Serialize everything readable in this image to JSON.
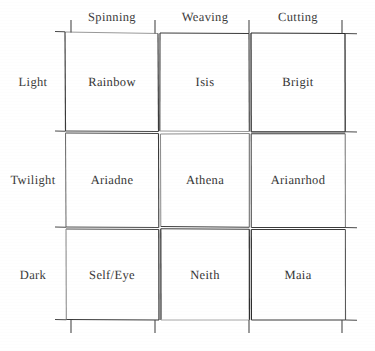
{
  "diagram": {
    "type": "matrix-grid",
    "rows": 3,
    "columns": 3,
    "column_headers": [
      {
        "label": "Spinning"
      },
      {
        "label": "Weaving"
      },
      {
        "label": "Cutting"
      }
    ],
    "row_headers": [
      {
        "label": "Light"
      },
      {
        "label": "Twilight"
      },
      {
        "label": "Dark"
      }
    ],
    "cells": [
      [
        {
          "label": "Rainbow"
        },
        {
          "label": "Isis"
        },
        {
          "label": "Brigit"
        }
      ],
      [
        {
          "label": "Ariadne"
        },
        {
          "label": "Athena"
        },
        {
          "label": "Arianrhod"
        }
      ],
      [
        {
          "label": "Self/Eye"
        },
        {
          "label": "Neith"
        },
        {
          "label": "Maia"
        }
      ]
    ],
    "colors": {
      "background": "#ffffff",
      "ink": "#323232",
      "line_dark": "#2e2e2e",
      "line_light": "#8c8c8c"
    }
  }
}
